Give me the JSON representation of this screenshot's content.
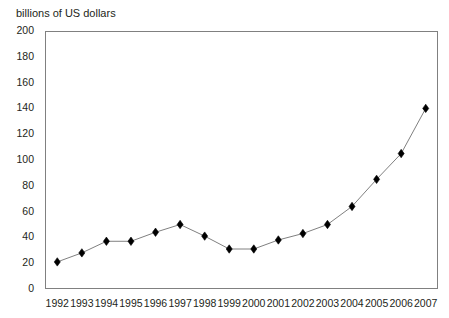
{
  "chart_data": {
    "type": "line",
    "title": "",
    "ylabel": "billions of US dollars",
    "xlabel": "",
    "grid": false,
    "legend": null,
    "ylim": [
      0,
      200
    ],
    "ytick_step": 20,
    "yticks": [
      0,
      20,
      40,
      60,
      80,
      100,
      120,
      140,
      160,
      180,
      200
    ],
    "ytick_labels": [
      "0",
      "20",
      "40",
      "60",
      "80",
      "100",
      "120",
      "140",
      "160",
      "180",
      "200"
    ],
    "categories": [
      1992,
      1993,
      1994,
      1995,
      1996,
      1997,
      1998,
      1999,
      2000,
      2001,
      2002,
      2003,
      2004,
      2005,
      2006,
      2007
    ],
    "xtick_labels": [
      "1992",
      "1993",
      "1994",
      "1995",
      "1996",
      "1997",
      "1998",
      "1999",
      "2000",
      "2001",
      "2002",
      "2003",
      "2004",
      "2005",
      "2006",
      "2007"
    ],
    "series": [
      {
        "name": "billions of US dollars",
        "marker": "diamond",
        "marker_color": "#000000",
        "line_color": "#808080",
        "values": [
          21,
          28,
          37,
          37,
          44,
          50,
          41,
          31,
          31,
          38,
          43,
          50,
          64,
          85,
          105,
          140
        ]
      }
    ]
  },
  "colors": {
    "axis": "#808080",
    "marker": "#000000",
    "line": "#808080",
    "text": "#231f20",
    "background": "#ffffff"
  }
}
